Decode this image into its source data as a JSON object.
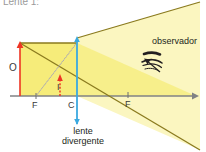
{
  "title": "Lente 1:",
  "diagram": {
    "type": "ray-diagram",
    "topic": "lente divergente",
    "labels": {
      "object": "O",
      "image": "I",
      "focus_left": "F",
      "center": "C",
      "focus_right": "F",
      "observer": "observador",
      "lens_line1": "lente",
      "lens_line2": "divergente",
      "lens_caption": "lente divergente"
    },
    "colors": {
      "object_arrow": "#ee3524",
      "image_arrow": "#ee3524",
      "lens": "#3aa9e0",
      "axis": "#808285",
      "ray": "#8a7a1e",
      "beam_fill": "#f6ec7a",
      "beam_fill_light": "#fbf6c0",
      "dashed_guide": "#b0aeb0",
      "text": "#231f20",
      "title": "#9a9a9a"
    },
    "geometry": {
      "axis_y": 96,
      "axis_x_start": 10,
      "axis_x_end": 196,
      "lens_x": 77,
      "lens_top_y": 37,
      "lens_bottom_y": 124,
      "object_x": 20,
      "object_top_y": 43,
      "focus_left_x": 36,
      "focus_right_x": 128,
      "image_x": 60,
      "image_top_y": 77
    },
    "icons": {
      "observer": "eye-icon",
      "axis_arrow": "arrow-right-icon",
      "lens_arrow_top": "arrow-up-icon",
      "lens_arrow_bottom": "arrow-down-icon"
    }
  }
}
